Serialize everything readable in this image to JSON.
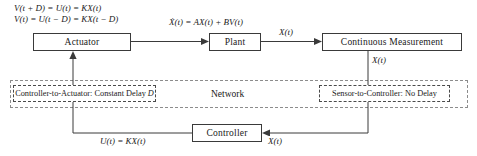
{
  "diagram": {
    "blocks": [
      {
        "id": "actuator",
        "label": "Actuator"
      },
      {
        "id": "plant",
        "label": "Plant"
      },
      {
        "id": "measurement",
        "label": "Continuous Measurement"
      },
      {
        "id": "controller",
        "label": "Controller"
      }
    ],
    "equations": {
      "actuator_line1": "V(t + D) = U(t) = KX(t)",
      "actuator_line2": "V(t) = U(t − D) = KX(t − D)",
      "plant": "Ẋ(t) = AX(t) + BV(t)",
      "controller": "U(t) = KX(t)"
    },
    "signals": {
      "plant_out": "X(t)",
      "measurement_out": "X(t)",
      "controller_in": "X(t)"
    },
    "network": {
      "label": "Network",
      "channels": [
        {
          "id": "controller-to-actuator",
          "label": "Controller-to-Actuator: Constant Delay",
          "param": "D"
        },
        {
          "id": "sensor-to-controller",
          "label": "Sensor-to-Controller: No Delay",
          "param": ""
        }
      ]
    },
    "colors": {
      "line": "#3a3a3a",
      "dashed_outer": "#8c8c8c",
      "dashed_inner": "#4a4a4a",
      "background": "#ffffff"
    }
  }
}
